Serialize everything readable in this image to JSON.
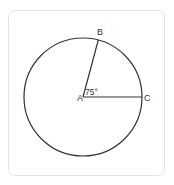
{
  "diagram": {
    "type": "circle-with-central-angle",
    "center": {
      "label": "A",
      "x": 83,
      "y": 97
    },
    "radius": 59,
    "points": [
      {
        "label": "B",
        "angle_deg": 75
      },
      {
        "label": "C",
        "angle_deg": 0
      }
    ],
    "angle_label": "75°",
    "colors": {
      "stroke": "#333333",
      "card_border": "#e2e2e2"
    }
  }
}
